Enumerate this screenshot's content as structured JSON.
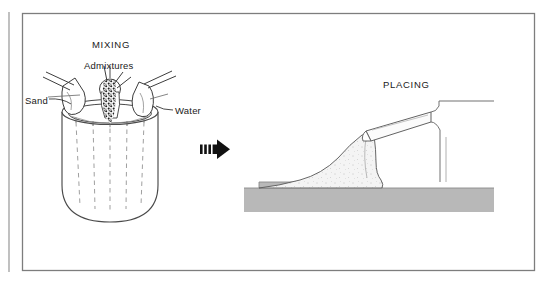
{
  "figure": {
    "title_left": "MIXING",
    "title_right": "PLACING",
    "labels": {
      "admixtures": "Admixtures",
      "sand": "Sand",
      "water": "Water"
    },
    "arrow": {
      "name": "process-flow-arrow",
      "direction": "right",
      "tail_stripes": 3
    },
    "colors": {
      "ink": "#1a1a1a",
      "frame": "#7d7d7d",
      "ground": "#b8b8b8",
      "ground_edge": "#8a8a8a",
      "concrete": "#f2f2f2",
      "speckle": "#2a2a2a",
      "paper": "#ffffff"
    },
    "elements": {
      "mixer_bowl": "mixer-bowl",
      "sand_chute": "sand-chute",
      "admixture_chute": "admixture-chute",
      "water_chute": "water-chute",
      "admixture_stream": "admixture-stream",
      "truck_chute": "truck-chute",
      "truck_body": "truck-body",
      "concrete_pour": "concrete-pour",
      "ground_slab": "ground-slab"
    }
  }
}
